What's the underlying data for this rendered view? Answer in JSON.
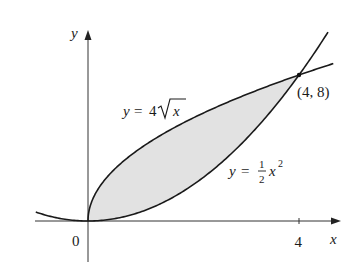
{
  "figure": {
    "type": "region-between-curves",
    "axes": {
      "x_label": "x",
      "y_label": "y",
      "origin_label": "0",
      "x_ticks": [
        {
          "value": 4,
          "label": "4"
        }
      ]
    },
    "curves": [
      {
        "name": "upper",
        "equation": "y = 4√x",
        "label_y": "y",
        "label_eq": "=",
        "label_coef": "4",
        "label_var": "x"
      },
      {
        "name": "lower",
        "equation": "y = ½x²",
        "label_y": "y",
        "label_eq": "=",
        "label_num": "1",
        "label_den": "2",
        "label_var": "x",
        "label_exp": "2"
      }
    ],
    "intersection": {
      "x": 4,
      "y": 8,
      "label": "(4, 8)"
    },
    "shaded_region": "between y = 4√x and y = ½x² for 0 ≤ x ≤ 4",
    "colors": {
      "curve": "#1a1a1a",
      "shade": "#e2e2e2",
      "axis": "#333333"
    }
  }
}
